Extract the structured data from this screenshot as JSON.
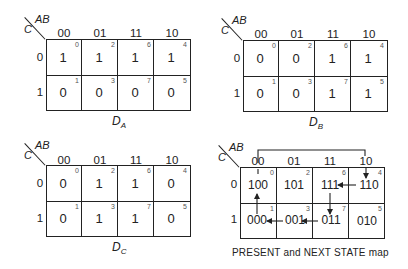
{
  "axes": {
    "row_var": "C",
    "col_var": "AB",
    "col_labels": [
      "00",
      "01",
      "11",
      "10"
    ],
    "row_labels": [
      "0",
      "1"
    ],
    "minterms": [
      [
        "0",
        "2",
        "6",
        "4"
      ],
      [
        "1",
        "3",
        "7",
        "5"
      ]
    ]
  },
  "maps": [
    {
      "id": "DA",
      "label": "D",
      "subscript": "A",
      "cells": [
        [
          "1",
          "1",
          "1",
          "1"
        ],
        [
          "0",
          "0",
          "0",
          "0"
        ]
      ]
    },
    {
      "id": "DB",
      "label": "D",
      "subscript": "B",
      "cells": [
        [
          "0",
          "0",
          "1",
          "1"
        ],
        [
          "0",
          "0",
          "1",
          "1"
        ]
      ]
    },
    {
      "id": "DC",
      "label": "D",
      "subscript": "C",
      "cells": [
        [
          "0",
          "1",
          "1",
          "0"
        ],
        [
          "0",
          "1",
          "1",
          "0"
        ]
      ]
    },
    {
      "id": "STATE",
      "caption": "PRESENT and NEXT STATE map",
      "cells": [
        [
          "100",
          "101",
          "111",
          "110"
        ],
        [
          "000",
          "001",
          "011",
          "010"
        ]
      ],
      "transitions": [
        {
          "from": "000",
          "to": "100"
        },
        {
          "from": "100",
          "to": "110"
        },
        {
          "from": "110",
          "to": "111"
        },
        {
          "from": "111",
          "to": "011"
        },
        {
          "from": "011",
          "to": "001"
        },
        {
          "from": "001",
          "to": "000"
        }
      ]
    }
  ]
}
